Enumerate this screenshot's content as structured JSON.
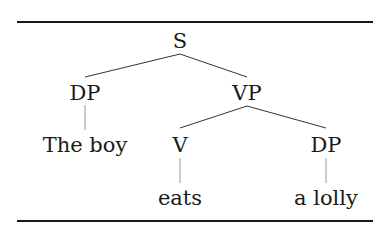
{
  "tree": {
    "root": "S",
    "nodes": {
      "s": "S",
      "dp_subject": "DP",
      "vp": "VP",
      "v": "V",
      "dp_object": "DP"
    },
    "leaves": {
      "subject": "The boy",
      "verb": "eats",
      "object": "a lolly"
    },
    "structure": "[S [DP The boy] [VP [V eats] [DP a lolly]]]"
  },
  "colors": {
    "text": "#1a1a1a",
    "branch": "#333333",
    "leaf_stem": "#9a9a9a",
    "rule": "#1a1a1a"
  }
}
